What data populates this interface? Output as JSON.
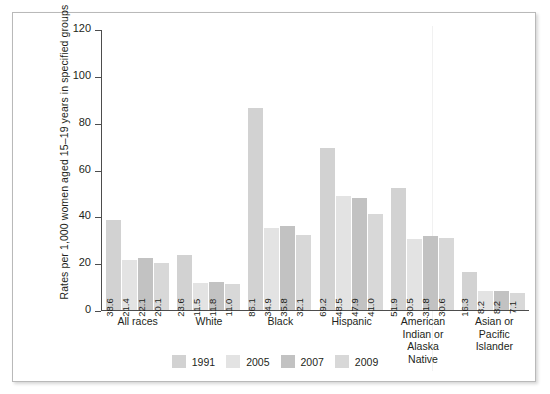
{
  "chart_data": {
    "type": "bar",
    "title": "",
    "xlabel": "",
    "ylabel": "Rates per 1,000 women aged 15–19 years in specified groups",
    "ylim": [
      0,
      120
    ],
    "yticks": [
      0,
      20,
      40,
      60,
      80,
      100,
      120
    ],
    "grid": false,
    "legend_position": "bottom",
    "categories": [
      "All races",
      "White",
      "Black",
      "Hispanic",
      "American Indian or Alaska Native",
      "Asian or Pacific Islander"
    ],
    "category_label_lines": [
      [
        "All races"
      ],
      [
        "White"
      ],
      [
        "Black"
      ],
      [
        "Hispanic"
      ],
      [
        "American",
        "Indian or",
        "Alaska",
        "Native"
      ],
      [
        "Asian or",
        "Pacific",
        "Islander"
      ]
    ],
    "series": [
      {
        "name": "1991",
        "color": "#d2d2d2",
        "values": [
          38.6,
          23.6,
          86.1,
          69.2,
          51.9,
          16.3
        ],
        "labels": [
          "38.6",
          "23.6",
          "86.1",
          "69.2",
          "51.9",
          "16.3"
        ]
      },
      {
        "name": "2005",
        "color": "#e3e3e3",
        "values": [
          21.4,
          11.5,
          34.9,
          48.5,
          30.5,
          8.2
        ],
        "labels": [
          "21.4",
          "11.5",
          "34.9",
          "48.5",
          "30.5",
          "8.2"
        ]
      },
      {
        "name": "2007",
        "color": "#c2c2c2",
        "values": [
          22.1,
          11.8,
          35.8,
          47.9,
          31.8,
          8.2
        ],
        "labels": [
          "22.1",
          "11.8",
          "35.8",
          "47.9",
          "31.8",
          "8.2"
        ]
      },
      {
        "name": "2009",
        "color": "#d8d8d8",
        "values": [
          20.1,
          11.0,
          32.1,
          41.0,
          30.6,
          7.1
        ],
        "labels": [
          "20.1",
          "11.0",
          "32.1",
          "41.0",
          "30.6",
          "7.1"
        ]
      }
    ]
  },
  "legend": {
    "items": [
      {
        "label": "1991",
        "color": "#d2d2d2"
      },
      {
        "label": "2005",
        "color": "#e3e3e3"
      },
      {
        "label": "2007",
        "color": "#c2c2c2"
      },
      {
        "label": "2009",
        "color": "#d8d8d8"
      }
    ]
  },
  "colors": {
    "axis": "#4d4d4d",
    "frame": "#b9b9b9",
    "text": "#231f20",
    "background": "#ffffff"
  }
}
